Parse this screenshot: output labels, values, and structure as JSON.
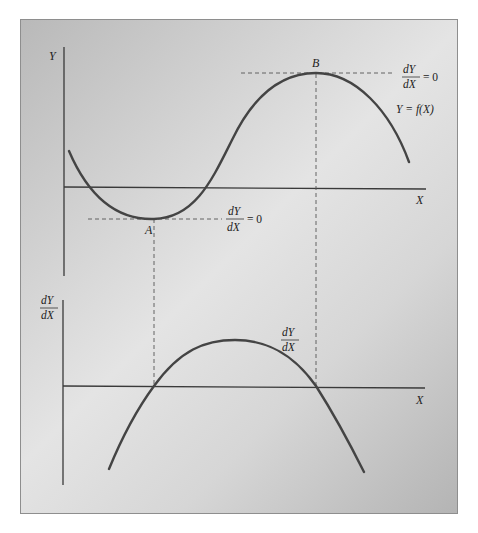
{
  "diagram": {
    "top_panel": {
      "y_axis_label": "Y",
      "x_axis_label": "X",
      "curve_label": "Y = f(X)",
      "point_a_label": "A",
      "point_b_label": "B",
      "point_a_annotation": {
        "numerator": "dY",
        "denominator": "dX",
        "equals": "= 0"
      },
      "point_b_annotation": {
        "numerator": "dY",
        "denominator": "dX",
        "equals": "= 0"
      }
    },
    "bottom_panel": {
      "y_axis_label": {
        "numerator": "dY",
        "denominator": "dX"
      },
      "x_axis_label": "X",
      "curve_label": {
        "numerator": "dY",
        "denominator": "dX"
      }
    },
    "colors": {
      "frame_gradient_dark": "#b4b4b4",
      "frame_gradient_light": "#e4e4e4",
      "stroke": "#3a3a3a",
      "curve": "#444444",
      "dashed": "#555555"
    }
  }
}
